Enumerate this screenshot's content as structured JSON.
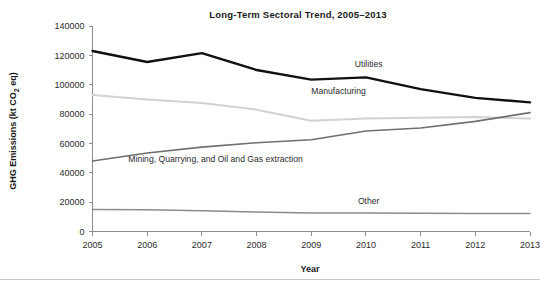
{
  "chart_data": {
    "type": "line",
    "title": "Long-Term Sectoral Trend, 2005–2013",
    "xlabel": "Year",
    "ylabel": "GHG Emissions (kt CO₂ eq)",
    "ylabel_parts": {
      "main": "GHG Emissions (kt CO",
      "sub": "2",
      "tail": " eq)"
    },
    "x": [
      2005,
      2006,
      2007,
      2008,
      2009,
      2010,
      2011,
      2012,
      2013
    ],
    "categories": [
      "2005",
      "2006",
      "2007",
      "2008",
      "2009",
      "2010",
      "2011",
      "2012",
      "2013"
    ],
    "xlim": [
      2005,
      2013
    ],
    "ylim": [
      0,
      140000
    ],
    "ytick_labels": [
      "0",
      "20000",
      "40000",
      "60000",
      "80000",
      "100000",
      "120000",
      "140000"
    ],
    "yticks": [
      0,
      20000,
      40000,
      60000,
      80000,
      100000,
      120000,
      140000
    ],
    "grid": false,
    "legend_position": "inline-labels",
    "series": [
      {
        "name": "Utilities",
        "color": "#111111",
        "width": 2.4,
        "values": [
          123000,
          115500,
          121500,
          110000,
          103500,
          105000,
          97000,
          91000,
          88000
        ],
        "label_x": 2010.05,
        "label_y": 112000
      },
      {
        "name": "Manufacturing",
        "color": "#d2d2d2",
        "width": 2.0,
        "values": [
          93000,
          90000,
          87500,
          83000,
          75500,
          77000,
          77500,
          78000,
          77000
        ],
        "label_x": 2009.5,
        "label_y": 93500
      },
      {
        "name": "Mining, Quarrying, and Oil and Gas extraction",
        "color": "#6f6f6f",
        "width": 1.6,
        "values": [
          48000,
          53500,
          57500,
          60500,
          62500,
          68500,
          70500,
          75000,
          81000
        ],
        "label_x": 2007.25,
        "label_y": 47500
      },
      {
        "name": "Other",
        "color": "#8c8c8c",
        "width": 1.5,
        "values": [
          15000,
          14800,
          14200,
          13300,
          12600,
          12600,
          12500,
          12300,
          12200
        ],
        "label_x": 2010.05,
        "label_y": 19000
      }
    ]
  }
}
